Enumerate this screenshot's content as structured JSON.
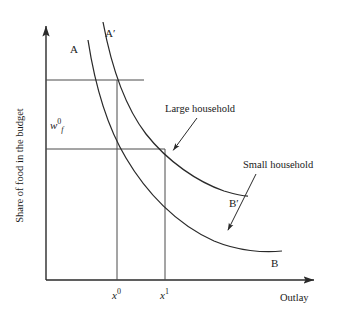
{
  "chart_data": {
    "type": "line",
    "title": "",
    "xlabel": "Outlay",
    "ylabel": "Share of food in the budget",
    "grid": false,
    "legend": "none",
    "axis_arrows": true,
    "xlim": [
      0,
      1
    ],
    "ylim": [
      0,
      1
    ],
    "annotations": [
      {
        "name": "large-household",
        "text": "Large household",
        "x": 165,
        "y": 104,
        "arrow_from": [
          197,
          118
        ],
        "arrow_to": [
          172,
          152
        ]
      },
      {
        "name": "small-household",
        "text": "Small household",
        "x": 243,
        "y": 160,
        "arrow_from": [
          256,
          174
        ],
        "arrow_to": [
          227,
          232
        ]
      }
    ],
    "curve_labels": [
      {
        "name": "curve-label-A",
        "text": "A",
        "x": 70,
        "y": 44
      },
      {
        "name": "curve-label-A-prime",
        "text": "A",
        "prime": "′",
        "x": 105,
        "y": 28
      },
      {
        "name": "curve-label-B-prime",
        "text": "B",
        "prime": "′",
        "x": 229,
        "y": 198
      },
      {
        "name": "curve-label-B",
        "text": "B",
        "x": 271,
        "y": 258
      }
    ],
    "x_ticks": [
      {
        "name": "x-tick-0",
        "text": "x",
        "sup": "0",
        "x": 112,
        "y": 288
      },
      {
        "name": "x-tick-1",
        "text": "x",
        "sup": "1",
        "x": 160,
        "y": 288
      }
    ],
    "y_ticks": [
      {
        "name": "y-tick-wf0",
        "text": "w",
        "sub": "f",
        "sup": "0"
      }
    ],
    "series": [
      {
        "name": "A-B",
        "label": "AB",
        "description": "Lower Engel curve: large household baseline, labelled A at top-left and B at lower right",
        "path": "M 88,40 C 96,92 108,128 126,158 C 146,192 176,224 214,241 C 238,251 264,253 282,251"
      },
      {
        "name": "A-prime-B-prime",
        "label": "A′B′",
        "description": "Upper Engel curve: small household, labelled A′ at top and B′ at right",
        "path": "M 103,22 C 112,70 126,108 146,134 C 168,162 198,182 224,191 C 234,194 242,196 248,196"
      }
    ],
    "reference_lines": [
      {
        "name": "upper-horizontal-guide",
        "x1": 46,
        "y1": 80,
        "x2": 144,
        "y2": 80
      },
      {
        "name": "lower-horizontal-guide",
        "x1": 46,
        "y1": 149,
        "x2": 165,
        "y2": 149
      },
      {
        "name": "x0-vertical-guide",
        "x1": 117,
        "y1": 80,
        "x2": 117,
        "y2": 280
      },
      {
        "name": "x1-vertical-guide",
        "x1": 165,
        "y1": 149,
        "x2": 165,
        "y2": 280
      }
    ],
    "axes": {
      "origin": [
        46,
        280
      ],
      "x_axis_end": [
        318,
        280
      ],
      "y_axis_end": [
        46,
        22
      ]
    }
  },
  "axis_titles": {
    "x": "Outlay",
    "y": "Share of food in the budget"
  }
}
